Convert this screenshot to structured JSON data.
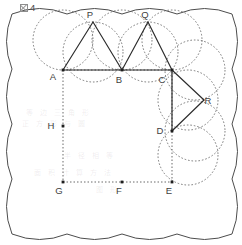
{
  "caption": {
    "glyph_name": "tofu-box-glyph",
    "number": "4"
  },
  "figure": {
    "title": "",
    "point_labels": {
      "A": "A",
      "B": "B",
      "C": "C",
      "D": "D",
      "E": "E",
      "F": "F",
      "G": "G",
      "H": "H",
      "P": "P",
      "Q": "Q",
      "R": "R"
    },
    "colors": {
      "solid_stroke": "#2b2b2b",
      "dotted_stroke": "#6b6b6b",
      "outline_stroke": "#4d4d4d",
      "label_fill": "#404040",
      "background": "#ffffff"
    },
    "points": [
      {
        "id": "A",
        "x": 63,
        "y": 70,
        "label": "A",
        "label_dx": -10,
        "label_dy": 10,
        "marked": true
      },
      {
        "id": "B",
        "x": 122,
        "y": 70,
        "label": "B",
        "label_dx": -3,
        "label_dy": 13,
        "marked": true
      },
      {
        "id": "C",
        "x": 172,
        "y": 70,
        "label": "C",
        "label_dx": -10,
        "label_dy": 13,
        "marked": true
      },
      {
        "id": "D",
        "x": 172,
        "y": 131,
        "label": "D",
        "label_dx": -12,
        "label_dy": 3,
        "marked": true
      },
      {
        "id": "E",
        "x": 172,
        "y": 182,
        "label": "E",
        "label_dx": -3,
        "label_dy": 12,
        "marked": true
      },
      {
        "id": "F",
        "x": 122,
        "y": 182,
        "label": "F",
        "label_dx": -3,
        "label_dy": 12,
        "marked": true
      },
      {
        "id": "G",
        "x": 63,
        "y": 182,
        "label": "G",
        "label_dx": -4,
        "label_dy": 12,
        "marked": true
      },
      {
        "id": "H",
        "x": 63,
        "y": 126,
        "label": "H",
        "label_dx": -12,
        "label_dy": 3,
        "marked": true
      },
      {
        "id": "P",
        "x": 93,
        "y": 22,
        "label": "P",
        "label_dx": -3,
        "label_dy": -4,
        "marked": false
      },
      {
        "id": "Q",
        "x": 148,
        "y": 22,
        "label": "Q",
        "label_dx": -3,
        "label_dy": -4,
        "marked": false
      },
      {
        "id": "R",
        "x": 204,
        "y": 100,
        "label": "R",
        "label_dx": 4,
        "label_dy": 4,
        "marked": false
      }
    ],
    "solid_segments": [
      {
        "name": "segment-A-B",
        "from": "A",
        "to": "B"
      },
      {
        "name": "segment-B-C",
        "from": "B",
        "to": "C"
      },
      {
        "name": "segment-A-P",
        "from": "A",
        "to": "P"
      },
      {
        "name": "segment-P-B",
        "from": "P",
        "to": "B"
      },
      {
        "name": "segment-B-Q",
        "from": "B",
        "to": "Q"
      },
      {
        "name": "segment-Q-C",
        "from": "Q",
        "to": "C"
      },
      {
        "name": "segment-C-D",
        "from": "C",
        "to": "D"
      },
      {
        "name": "segment-C-R",
        "from": "C",
        "to": "R"
      },
      {
        "name": "segment-R-D",
        "from": "R",
        "to": "D"
      }
    ],
    "dotted_segments": [
      {
        "name": "segment-A-G",
        "from": "A",
        "to": "G"
      },
      {
        "name": "segment-G-E",
        "from": "G",
        "to": "E"
      },
      {
        "name": "segment-E-C",
        "from": "E",
        "to": "C"
      },
      {
        "name": "segment-A-C-dotted",
        "from": "A",
        "to": "C"
      }
    ],
    "dotted_circles": [
      {
        "name": "circle-at-A",
        "cx": 63,
        "cy": 40,
        "r": 30
      },
      {
        "name": "circle-at-P-left",
        "cx": 93,
        "cy": 52,
        "r": 30
      },
      {
        "name": "circle-at-B",
        "cx": 122,
        "cy": 40,
        "r": 30
      },
      {
        "name": "circle-at-Q-left",
        "cx": 148,
        "cy": 52,
        "r": 30
      },
      {
        "name": "circle-at-C-top",
        "cx": 172,
        "cy": 40,
        "r": 30
      },
      {
        "name": "circle-at-C-right",
        "cx": 195,
        "cy": 70,
        "r": 30
      },
      {
        "name": "circle-at-R-upper",
        "cx": 188,
        "cy": 100,
        "r": 30
      },
      {
        "name": "circle-at-D-right",
        "cx": 195,
        "cy": 131,
        "r": 30
      },
      {
        "name": "circle-at-D-lower",
        "cx": 188,
        "cy": 155,
        "r": 30
      }
    ],
    "outer_boundary": {
      "name": "scalloped-flower-outline",
      "description": "rounded square outline built from outward circular arcs (scallops) on all four sides",
      "scallops_per_side": 4,
      "bounds": {
        "left": 12,
        "top": 14,
        "right": 232,
        "bottom": 234
      }
    },
    "ghost_text": [
      {
        "text": "等 边 三 角 形",
        "x": 26,
        "y": 107
      },
      {
        "text": "正 方 形 与 圆",
        "x": 22,
        "y": 118
      },
      {
        "text": "半 径 相 等",
        "x": 64,
        "y": 150
      },
      {
        "text": "面 积 计 算 方 法",
        "x": 34,
        "y": 167
      },
      {
        "text": "图 形",
        "x": 96,
        "y": 184
      }
    ]
  }
}
